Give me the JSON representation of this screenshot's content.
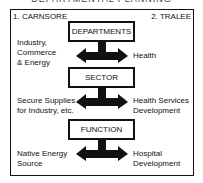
{
  "title": "DEPARTMENTAL PLANNING",
  "corners": {
    "left": "1. CARNSORE",
    "right": "2. TRALEE"
  },
  "levels": [
    {
      "box": "DEPARTMENTS",
      "left": [
        "Industry,",
        "Commerce",
        "& Energy"
      ],
      "right": [
        "Health"
      ]
    },
    {
      "box": "SECTOR",
      "left": [
        "Secure Supplies",
        "for Industry, etc."
      ],
      "right": [
        "Health Services",
        "Development"
      ]
    },
    {
      "box": "FUNCTION",
      "left": [
        "Native Energy",
        "Source"
      ],
      "right": [
        "Hospital",
        "Development"
      ]
    }
  ]
}
